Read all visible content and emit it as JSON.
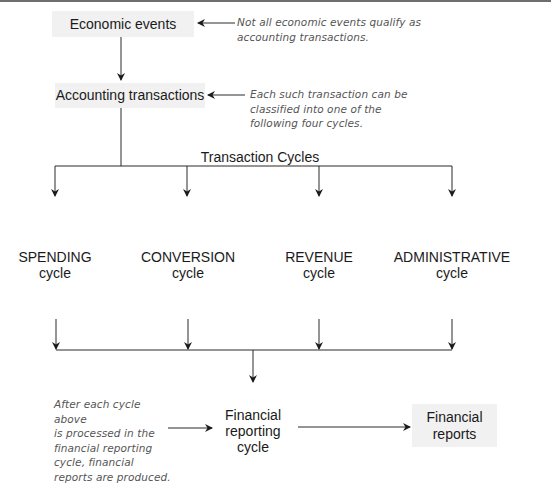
{
  "diagram": {
    "nodes": {
      "economic_events": "Economic events",
      "accounting_transactions": "Accounting transactions",
      "transaction_cycles_label": "Transaction Cycles",
      "cycles": [
        {
          "name": "SPENDING",
          "sub": "cycle"
        },
        {
          "name": "CONVERSION",
          "sub": "cycle"
        },
        {
          "name": "REVENUE",
          "sub": "cycle"
        },
        {
          "name": "ADMINISTRATIVE",
          "sub": "cycle"
        }
      ],
      "financial_reporting_cycle": [
        "Financial",
        "reporting",
        "cycle"
      ],
      "financial_reports": [
        "Financial",
        "reports"
      ]
    },
    "notes": {
      "economic_events_note": [
        "Not all economic events qualify as",
        "accounting transactions."
      ],
      "accounting_transactions_note": [
        "Each such transaction can be",
        "classified into one of the",
        "following four cycles."
      ],
      "financial_reporting_note": [
        "After each cycle above",
        "is processed in the",
        "financial reporting",
        "cycle, financial",
        "reports are produced."
      ]
    },
    "colors": {
      "box_fill": "#f1f1f1",
      "line": "#2a2a2a",
      "note_text": "#555555"
    }
  }
}
